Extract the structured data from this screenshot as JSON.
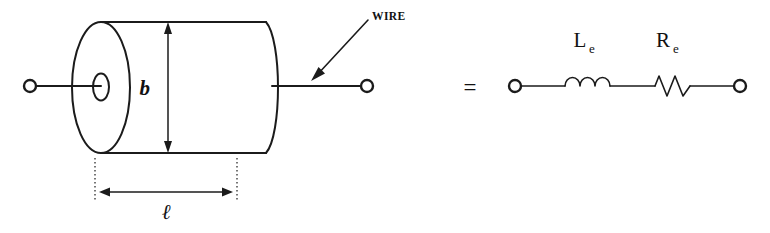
{
  "figure": {
    "background_color": "#ffffff",
    "ink_color": "#1b1b1b"
  },
  "coil_diagram": {
    "name": "cylindrical coil",
    "dimensions": [
      {
        "id": "diameter",
        "label": "b",
        "orientation": "vertical",
        "description": "coil outer diameter"
      },
      {
        "id": "length",
        "label": "ℓ",
        "orientation": "horizontal",
        "description": "coil axial length"
      }
    ],
    "annotations": [
      {
        "id": "wire-callout",
        "label": "WIRE",
        "pointer": "arrow pointing down-left to the right-hand lead"
      }
    ],
    "terminals": [
      {
        "id": "left-terminal",
        "position": "left lead end"
      },
      {
        "id": "right-terminal",
        "position": "right lead end"
      }
    ]
  },
  "equivalence": {
    "symbol": "=",
    "meaning": "is equivalent to"
  },
  "circuit_diagram": {
    "name": "series equivalent circuit",
    "components": [
      {
        "id": "inductor",
        "symbol": "inductor-coil",
        "label_base": "L",
        "label_sub": "e",
        "label_full": "Le"
      },
      {
        "id": "resistor",
        "symbol": "resistor-zigzag",
        "label_base": "R",
        "label_sub": "e",
        "label_full": "Re"
      }
    ],
    "terminals": [
      {
        "id": "left-terminal",
        "position": "left node"
      },
      {
        "id": "right-terminal",
        "position": "right node"
      }
    ]
  }
}
